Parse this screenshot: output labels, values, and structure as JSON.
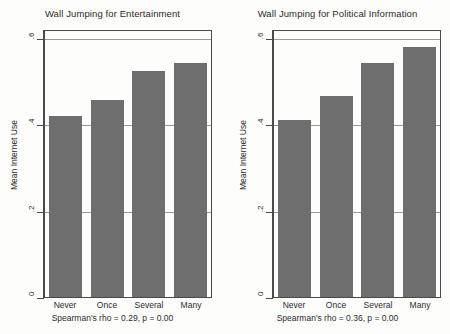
{
  "figure": {
    "background": "#fdfdfb",
    "bar_color": "#6e6e6e",
    "axis_color": "#4a4a4a",
    "grid_color": "#9a9a9a"
  },
  "chart_data": [
    {
      "type": "bar",
      "title": "Wall Jumping for Entertainment",
      "xlabel": "",
      "ylabel": "Mean Internet Use",
      "categories": [
        "Never",
        "Once",
        "Several",
        "Many"
      ],
      "values": [
        0.45,
        0.49,
        0.56,
        0.58
      ],
      "ylim": [
        0,
        0.66
      ],
      "yticks": [
        0,
        0.2,
        0.4,
        0.6
      ],
      "ytick_labels": [
        "0",
        ".2",
        ".4",
        ".6"
      ],
      "grid": true,
      "legend": "none",
      "annotation": "Spearman's rho = 0.29, p = 0.00",
      "stats": {
        "rho": "0.29",
        "p": "0.00"
      }
    },
    {
      "type": "bar",
      "title": "Wall Jumping for Political Information",
      "xlabel": "",
      "ylabel": "Mean Internet Use",
      "categories": [
        "Never",
        "Once",
        "Several",
        "Many"
      ],
      "values": [
        0.44,
        0.5,
        0.58,
        0.62
      ],
      "ylim": [
        0,
        0.66
      ],
      "yticks": [
        0,
        0.2,
        0.4,
        0.6
      ],
      "ytick_labels": [
        "0",
        ".2",
        ".4",
        ".6"
      ],
      "grid": true,
      "legend": "none",
      "annotation": "Spearman's rho = 0.36, p = 0.00",
      "stats": {
        "rho": "0.36",
        "p": "0.00"
      }
    }
  ]
}
